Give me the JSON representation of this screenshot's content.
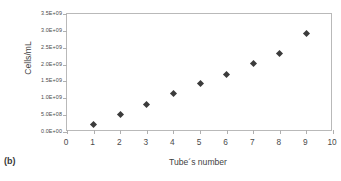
{
  "caption": "(b)",
  "chart_data": {
    "type": "scatter",
    "title": "",
    "xlabel": "Tube´s number",
    "ylabel": "Cells/mL",
    "x": [
      1,
      2,
      3,
      4,
      5,
      6,
      7,
      8,
      9
    ],
    "values": [
      220000000,
      520000000,
      830000000,
      1150000000,
      1450000000,
      1700000000,
      2020000000,
      2320000000,
      2930000000
    ],
    "xlim": [
      0,
      10
    ],
    "ylim": [
      0,
      3500000000
    ],
    "xticks": [
      "0",
      "1",
      "2",
      "3",
      "4",
      "5",
      "6",
      "7",
      "8",
      "9",
      "10"
    ],
    "xtick_values": [
      0,
      1,
      2,
      3,
      4,
      5,
      6,
      7,
      8,
      9,
      10
    ],
    "yticks": [
      "0.0E+00",
      "5.0E+08",
      "1.0E+09",
      "1.5E+09",
      "2.0E+09",
      "2.5E+09",
      "3.0E+09",
      "3.5E+09"
    ],
    "ytick_values": [
      0,
      500000000,
      1000000000,
      1500000000,
      2000000000,
      2500000000,
      3000000000,
      3500000000
    ],
    "grid": false,
    "legend": false,
    "marker_color": "#3b3b3b",
    "marker_shape": "diamond",
    "frame_color": "#b9b9b9"
  }
}
